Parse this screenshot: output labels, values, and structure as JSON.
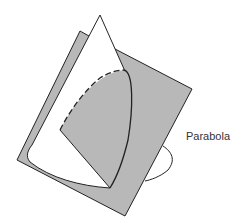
{
  "figure": {
    "type": "conic-section-diagram",
    "label": "Parabola",
    "colors": {
      "plane_fill": "#b8b8b8",
      "cone_fill": "#ffffff",
      "stroke": "#222222"
    }
  }
}
